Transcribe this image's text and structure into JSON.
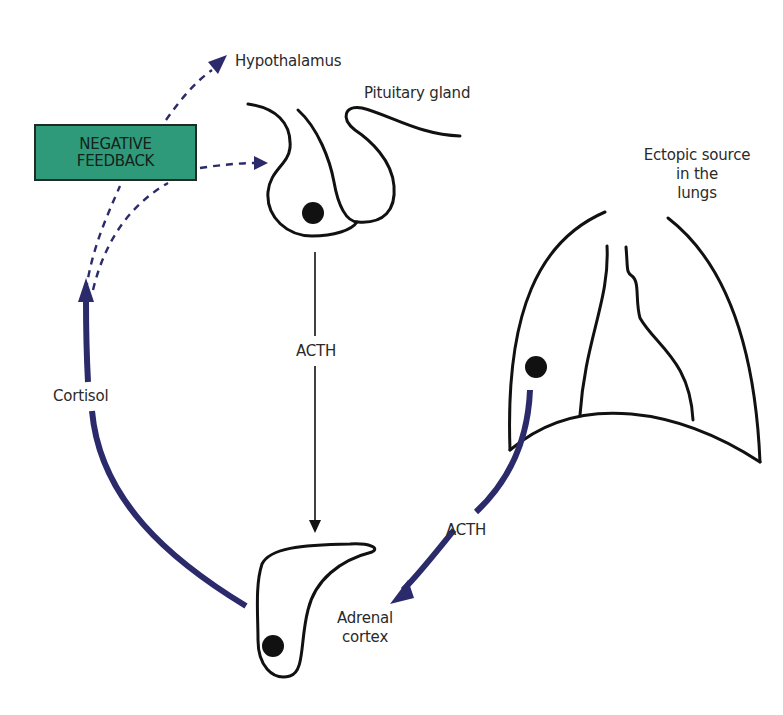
{
  "diagram": {
    "title": "",
    "colors": {
      "outline": "#111111",
      "feedback_arrow": "#2b2a6b",
      "hormone_arrow": "#2b2a6b",
      "feedback_box_fill": "#2f9a79",
      "feedback_box_border": "#1f2b24",
      "text": "#2a2a2a",
      "background": "#ffffff"
    },
    "nodes": {
      "hypothalamus": {
        "label": "Hypothalamus"
      },
      "pituitary": {
        "label": "Pituitary gland"
      },
      "ectopic": {
        "line1": "Ectopic source",
        "line2": "in the",
        "line3": "lungs"
      },
      "adrenal": {
        "line1": "Adrenal",
        "line2": "cortex"
      },
      "negative_feedback": {
        "line1": "NEGATIVE",
        "line2": "FEEDBACK"
      }
    },
    "edges": {
      "pituitary_to_adrenal": {
        "label": "ACTH",
        "style": "thin-solid"
      },
      "lungs_to_adrenal": {
        "label": "ACTH",
        "style": "thick-solid"
      },
      "adrenal_to_feedback": {
        "label": "Cortisol",
        "style": "thick-solid"
      },
      "feedback_to_hypothalamus": {
        "label": "",
        "style": "dashed"
      },
      "feedback_to_pituitary": {
        "label": "",
        "style": "dashed"
      }
    }
  }
}
